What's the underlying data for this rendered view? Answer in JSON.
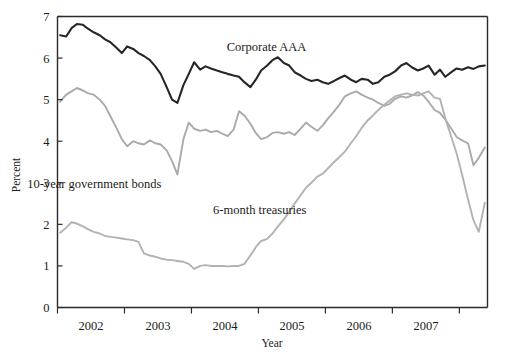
{
  "chart_data": {
    "type": "line",
    "title": "",
    "xlabel": "Year",
    "ylabel": "Percent",
    "xlim": [
      2001.5,
      2007.92
    ],
    "ylim": [
      0,
      7
    ],
    "grid": false,
    "legend": "inline-annotations",
    "x_tick_labels": [
      "2002",
      "2003",
      "2004",
      "2005",
      "2006",
      "2007"
    ],
    "x_tick_values": [
      2002,
      2003,
      2004,
      2005,
      2006,
      2007
    ],
    "x_tick_boundaries": [
      2001.5,
      2002.5,
      2003.5,
      2004.5,
      2005.5,
      2006.5,
      2007.5
    ],
    "y_tick_labels": [
      "0",
      "1",
      "2",
      "3",
      "4",
      "5",
      "6",
      "7"
    ],
    "y_tick_values": [
      0,
      1,
      2,
      3,
      4,
      5,
      6,
      7
    ],
    "colors": {
      "corporate_aaa": "#262626",
      "ten_year_government_bonds": "#aaaaaa",
      "six_month_treasuries": "#b2b2b2",
      "axis": "#2b2b2b",
      "background": "#ffffff"
    },
    "annotations": [
      {
        "text": "Corporate AAA",
        "x": 2004.62,
        "y": 6.18
      },
      {
        "text": "10-year government bonds",
        "x": 2002.05,
        "y": 2.87
      },
      {
        "text": "6-month treasuries",
        "x": 2004.52,
        "y": 2.25
      }
    ],
    "series": [
      {
        "name": "Corporate AAA",
        "color": "#262626",
        "x": [
          2001.54,
          2001.63,
          2001.71,
          2001.79,
          2001.88,
          2001.96,
          2002.04,
          2002.13,
          2002.21,
          2002.29,
          2002.38,
          2002.46,
          2002.54,
          2002.63,
          2002.71,
          2002.79,
          2002.88,
          2002.96,
          2003.04,
          2003.13,
          2003.21,
          2003.29,
          2003.38,
          2003.46,
          2003.54,
          2003.63,
          2003.71,
          2003.79,
          2003.88,
          2003.96,
          2004.04,
          2004.13,
          2004.21,
          2004.29,
          2004.38,
          2004.46,
          2004.54,
          2004.63,
          2004.71,
          2004.79,
          2004.88,
          2004.96,
          2005.04,
          2005.13,
          2005.21,
          2005.29,
          2005.38,
          2005.46,
          2005.54,
          2005.63,
          2005.71,
          2005.79,
          2005.88,
          2005.96,
          2006.04,
          2006.13,
          2006.21,
          2006.29,
          2006.38,
          2006.46,
          2006.54,
          2006.63,
          2006.71,
          2006.79,
          2006.88,
          2006.96,
          2007.04,
          2007.13,
          2007.21,
          2007.29,
          2007.38,
          2007.46,
          2007.54,
          2007.63,
          2007.71,
          2007.79,
          2007.88
        ],
        "values": [
          6.55,
          6.52,
          6.72,
          6.82,
          6.8,
          6.7,
          6.62,
          6.55,
          6.45,
          6.38,
          6.25,
          6.12,
          6.28,
          6.22,
          6.12,
          6.05,
          5.95,
          5.8,
          5.62,
          5.3,
          5.0,
          4.92,
          5.35,
          5.62,
          5.9,
          5.72,
          5.8,
          5.75,
          5.7,
          5.66,
          5.62,
          5.58,
          5.55,
          5.42,
          5.3,
          5.48,
          5.7,
          5.82,
          5.95,
          6.02,
          5.88,
          5.82,
          5.66,
          5.58,
          5.5,
          5.45,
          5.48,
          5.42,
          5.38,
          5.45,
          5.52,
          5.58,
          5.48,
          5.42,
          5.5,
          5.48,
          5.38,
          5.42,
          5.55,
          5.6,
          5.68,
          5.82,
          5.88,
          5.78,
          5.7,
          5.75,
          5.82,
          5.6,
          5.72,
          5.55,
          5.66,
          5.75,
          5.72,
          5.78,
          5.74,
          5.8,
          5.82
        ]
      },
      {
        "name": "10-year government bonds",
        "color": "#aaaaaa",
        "x": [
          2001.54,
          2001.63,
          2001.71,
          2001.79,
          2001.88,
          2001.96,
          2002.04,
          2002.13,
          2002.21,
          2002.29,
          2002.38,
          2002.46,
          2002.54,
          2002.63,
          2002.71,
          2002.79,
          2002.88,
          2002.96,
          2003.04,
          2003.13,
          2003.21,
          2003.29,
          2003.38,
          2003.46,
          2003.54,
          2003.63,
          2003.71,
          2003.79,
          2003.88,
          2003.96,
          2004.04,
          2004.13,
          2004.21,
          2004.29,
          2004.38,
          2004.46,
          2004.54,
          2004.63,
          2004.71,
          2004.79,
          2004.88,
          2004.96,
          2005.04,
          2005.13,
          2005.21,
          2005.29,
          2005.38,
          2005.46,
          2005.54,
          2005.63,
          2005.71,
          2005.79,
          2005.88,
          2005.96,
          2006.04,
          2006.13,
          2006.21,
          2006.29,
          2006.38,
          2006.46,
          2006.54,
          2006.63,
          2006.71,
          2006.79,
          2006.88,
          2006.96,
          2007.04,
          2007.13,
          2007.21,
          2007.29,
          2007.38,
          2007.46,
          2007.54,
          2007.63,
          2007.71,
          2007.79,
          2007.88
        ],
        "values": [
          4.95,
          5.12,
          5.2,
          5.28,
          5.22,
          5.15,
          5.12,
          5.0,
          4.85,
          4.6,
          4.32,
          4.05,
          3.88,
          4.0,
          3.95,
          3.92,
          4.02,
          3.95,
          3.92,
          3.78,
          3.52,
          3.2,
          4.05,
          4.45,
          4.3,
          4.25,
          4.28,
          4.22,
          4.25,
          4.18,
          4.12,
          4.28,
          4.72,
          4.62,
          4.42,
          4.2,
          4.05,
          4.1,
          4.2,
          4.22,
          4.18,
          4.22,
          4.15,
          4.3,
          4.45,
          4.35,
          4.25,
          4.38,
          4.55,
          4.72,
          4.88,
          5.08,
          5.15,
          5.2,
          5.12,
          5.05,
          5.0,
          4.92,
          4.85,
          4.9,
          5.02,
          5.08,
          5.05,
          5.1,
          5.18,
          5.1,
          4.95,
          4.75,
          4.68,
          4.52,
          4.3,
          4.1,
          4.02,
          3.95,
          3.42,
          3.6,
          3.85
        ]
      },
      {
        "name": "6-month treasuries",
        "color": "#b2b2b2",
        "x": [
          2001.54,
          2001.63,
          2001.71,
          2001.79,
          2001.88,
          2001.96,
          2002.04,
          2002.13,
          2002.21,
          2002.29,
          2002.38,
          2002.46,
          2002.54,
          2002.63,
          2002.71,
          2002.79,
          2002.88,
          2002.96,
          2003.04,
          2003.13,
          2003.21,
          2003.29,
          2003.38,
          2003.46,
          2003.54,
          2003.63,
          2003.71,
          2003.79,
          2003.88,
          2003.96,
          2004.04,
          2004.13,
          2004.21,
          2004.29,
          2004.38,
          2004.46,
          2004.54,
          2004.63,
          2004.71,
          2004.79,
          2004.88,
          2004.96,
          2005.04,
          2005.13,
          2005.21,
          2005.29,
          2005.38,
          2005.46,
          2005.54,
          2005.63,
          2005.71,
          2005.79,
          2005.88,
          2005.96,
          2006.04,
          2006.13,
          2006.21,
          2006.29,
          2006.38,
          2006.46,
          2006.54,
          2006.63,
          2006.71,
          2006.79,
          2006.88,
          2006.96,
          2007.04,
          2007.13,
          2007.21,
          2007.29,
          2007.38,
          2007.46,
          2007.54,
          2007.63,
          2007.71,
          2007.79,
          2007.88
        ],
        "values": [
          1.8,
          1.92,
          2.05,
          2.02,
          1.95,
          1.88,
          1.82,
          1.78,
          1.72,
          1.7,
          1.68,
          1.66,
          1.64,
          1.62,
          1.58,
          1.3,
          1.25,
          1.22,
          1.18,
          1.15,
          1.14,
          1.12,
          1.1,
          1.05,
          0.93,
          1.0,
          1.02,
          1.0,
          1.0,
          1.0,
          0.99,
          1.0,
          1.0,
          1.05,
          1.25,
          1.45,
          1.6,
          1.65,
          1.78,
          1.95,
          2.12,
          2.3,
          2.5,
          2.7,
          2.88,
          3.0,
          3.15,
          3.22,
          3.35,
          3.5,
          3.62,
          3.75,
          3.95,
          4.12,
          4.32,
          4.5,
          4.62,
          4.75,
          4.88,
          4.98,
          5.08,
          5.12,
          5.15,
          5.12,
          5.1,
          5.15,
          5.2,
          5.05,
          5.02,
          4.55,
          4.1,
          3.7,
          3.2,
          2.6,
          2.1,
          1.82,
          2.52
        ]
      }
    ]
  }
}
